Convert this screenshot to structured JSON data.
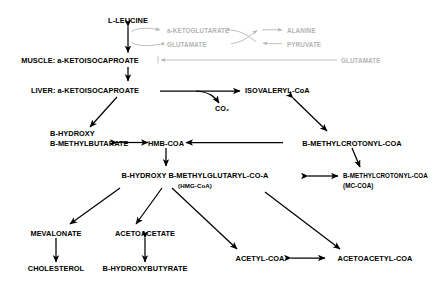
{
  "diagram": {
    "colors": {
      "primary": "#000000",
      "faded": "#b4b4b4",
      "background": "#ffffff"
    },
    "nodes": {
      "leucine": "L-LEUCINE",
      "muscle_kic": "MUSCLE: a-KETOISOCAPROATE",
      "liver_kic": "LIVER: a-KETOISOCAPROATE",
      "co2": "CO₂",
      "isovaleryl_coa": "ISOVALERYL-CoA",
      "hmb_line1": "B-HYDROXY",
      "hmb_line2": "B-METHYLBUTARATE",
      "hmb_coa": "HMB-COA",
      "methylcrotonyl_coa": "B-METHYLCROTONYL-COA",
      "hmg_line1": "B-HYDROXY B-METHYLGLUTARYL-CO-A",
      "hmg_line2": "(HMG-CoA)",
      "mc_coa_line1": "B-METHYLCROTONYL-COA",
      "mc_coa_line2": "(MC-COA)",
      "mevalonate": "MEVALONATE",
      "cholesterol": "CHOLESTEROL",
      "acetoacetate": "ACETOACETATE",
      "hydroxybutyrate": "B-HYDROXYBUTYRATE",
      "acetyl_coa": "ACETYL-COA",
      "acetoacetyl_coa": "ACETOACETYL-COA"
    },
    "faded_nodes": {
      "ketoglutarate": "a-KETOGLUTARATE",
      "glutamate_cycle": "GLUTAMATE",
      "alanine": "ALANINE",
      "pyruvate": "PYRUVATE",
      "glutamate_efflux": "GLUTAMATE"
    }
  }
}
